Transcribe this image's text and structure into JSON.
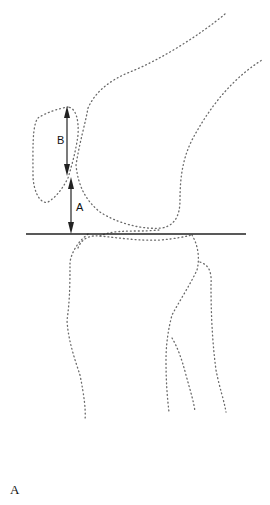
{
  "figure": {
    "labels": {
      "measure_b": "B",
      "measure_a": "A"
    },
    "caption": "A",
    "structures": [
      "femur",
      "patella",
      "tibia",
      "fibula",
      "joint-line"
    ]
  }
}
